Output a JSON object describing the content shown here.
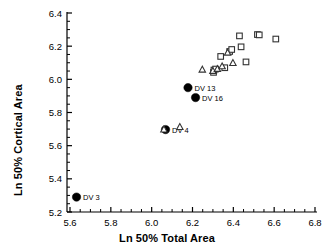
{
  "chart_data": {
    "type": "scatter",
    "title": "",
    "xlabel": "Ln 50% Total Area",
    "ylabel": "Ln 50% Cortical Area",
    "xlim": [
      5.6,
      6.8
    ],
    "ylim": [
      5.2,
      6.4
    ],
    "xticks": [
      5.6,
      5.8,
      6.0,
      6.2,
      6.4,
      6.6,
      6.8
    ],
    "xticklabels": [
      "5.6",
      "5.8",
      "6.0",
      "6.2",
      "6.4",
      "6.6",
      "6.8"
    ],
    "yticks": [
      5.2,
      5.4,
      5.6,
      5.8,
      6.0,
      6.2,
      6.4
    ],
    "yticklabels": [
      "5.2",
      "5.4",
      "5.6",
      "5.8",
      "6.0",
      "6.2",
      "6.4"
    ],
    "minor_tick_interval": 0.05,
    "grid": false,
    "legend": null,
    "frame": "left-bottom",
    "series": [
      {
        "name": "filled-circles",
        "marker": "filled-circle",
        "color": "#000000",
        "points": [
          {
            "x": 5.632,
            "y": 5.29,
            "label": "DV 3"
          },
          {
            "x": 6.068,
            "y": 5.697,
            "label": "DV 4"
          },
          {
            "x": 6.178,
            "y": 5.95,
            "label": "DV 13"
          },
          {
            "x": 6.215,
            "y": 5.89,
            "label": "DV 16"
          }
        ]
      },
      {
        "name": "open-squares",
        "marker": "open-square",
        "color": "#333333",
        "points": [
          {
            "x": 6.303,
            "y": 6.042
          },
          {
            "x": 6.305,
            "y": 6.056
          },
          {
            "x": 6.313,
            "y": 6.062
          },
          {
            "x": 6.338,
            "y": 6.138
          },
          {
            "x": 6.358,
            "y": 6.07
          },
          {
            "x": 6.382,
            "y": 6.168
          },
          {
            "x": 6.392,
            "y": 6.18
          },
          {
            "x": 6.43,
            "y": 6.262
          },
          {
            "x": 6.438,
            "y": 6.196
          },
          {
            "x": 6.462,
            "y": 6.105
          },
          {
            "x": 6.518,
            "y": 6.27
          },
          {
            "x": 6.527,
            "y": 6.268
          },
          {
            "x": 6.608,
            "y": 6.243
          }
        ]
      },
      {
        "name": "open-triangles",
        "marker": "open-triangle",
        "color": "#333333",
        "points": [
          {
            "x": 6.06,
            "y": 5.697
          },
          {
            "x": 6.138,
            "y": 5.712
          },
          {
            "x": 6.248,
            "y": 6.058
          },
          {
            "x": 6.3,
            "y": 6.05
          },
          {
            "x": 6.322,
            "y": 6.062
          },
          {
            "x": 6.345,
            "y": 6.078
          },
          {
            "x": 6.372,
            "y": 6.16
          },
          {
            "x": 6.398,
            "y": 6.098
          }
        ]
      }
    ]
  }
}
